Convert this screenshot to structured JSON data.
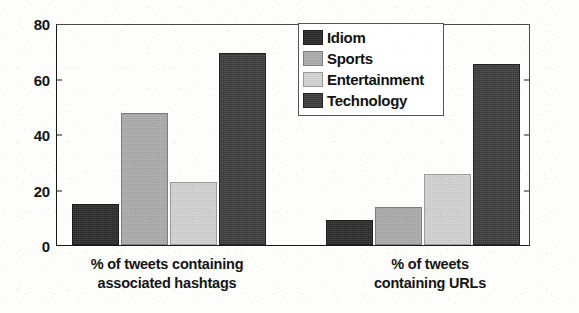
{
  "chart_data": {
    "type": "bar",
    "title": "",
    "xlabel": "",
    "ylabel": "",
    "ylim": [
      0,
      80
    ],
    "yticks": [
      0,
      20,
      40,
      60,
      80
    ],
    "grid": false,
    "legend_position": "upper-center-right",
    "categories": [
      "% of tweets containing associated hashtags",
      "% of tweets containing URLs"
    ],
    "category_lines": [
      [
        "% of tweets containing",
        "associated hashtags"
      ],
      [
        "% of tweets",
        "containing URLs"
      ]
    ],
    "series": [
      {
        "name": "Idiom",
        "color": "#2b2b2b",
        "values": [
          15,
          9
        ]
      },
      {
        "name": "Sports",
        "color": "#ababab",
        "values": [
          48,
          14
        ]
      },
      {
        "name": "Entertainment",
        "color": "#d2d2d2",
        "values": [
          23,
          26
        ]
      },
      {
        "name": "Technology",
        "color": "#3d3d3d",
        "values": [
          70,
          66
        ]
      }
    ]
  },
  "axis": {
    "y_tick_labels": [
      "0",
      "20",
      "40",
      "60",
      "80"
    ]
  },
  "legend": {
    "entries": [
      {
        "label": "Idiom"
      },
      {
        "label": "Sports"
      },
      {
        "label": "Entertainment"
      },
      {
        "label": "Technology"
      }
    ]
  }
}
